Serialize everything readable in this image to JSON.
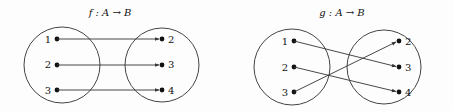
{
  "diagrams": [
    {
      "title": "f : A → B",
      "domain_set": {
        "name": "A",
        "elements": [
          "1",
          "2",
          "3"
        ]
      },
      "codomain_set": {
        "name": "B",
        "elements": [
          "2",
          "3",
          "4"
        ]
      },
      "mapping": [
        {
          "from": "1",
          "to": "2"
        },
        {
          "from": "2",
          "to": "3"
        },
        {
          "from": "3",
          "to": "4"
        }
      ]
    },
    {
      "title": "g : A → B",
      "domain_set": {
        "name": "A",
        "elements": [
          "1",
          "2",
          "3"
        ]
      },
      "codomain_set": {
        "name": "B",
        "elements": [
          "2",
          "3",
          "4"
        ]
      },
      "mapping": [
        {
          "from": "1",
          "to": "3"
        },
        {
          "from": "2",
          "to": "4"
        },
        {
          "from": "3",
          "to": "2"
        }
      ]
    }
  ],
  "colors": {
    "stroke": "#444444",
    "dot": "#111111",
    "background": "#fdfdfd"
  }
}
